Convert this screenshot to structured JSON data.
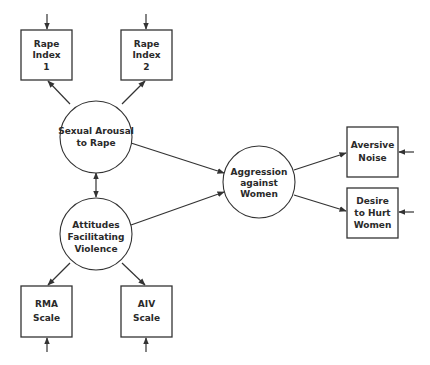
{
  "diagram": {
    "type": "path-model",
    "colors": {
      "stroke": "#333333",
      "text": "#2a2a2a",
      "background": "#ffffff"
    },
    "latent": [
      {
        "id": "arousal",
        "lines": [
          "Sexual Arousal",
          "to Rape"
        ]
      },
      {
        "id": "attitudes",
        "lines": [
          "Attitudes",
          "Facilitating",
          "Violence"
        ]
      },
      {
        "id": "aggression",
        "lines": [
          "Aggression",
          "against",
          "Women"
        ]
      }
    ],
    "observed": [
      {
        "id": "rape1",
        "lines": [
          "Rape",
          "Index",
          "1"
        ]
      },
      {
        "id": "rape2",
        "lines": [
          "Rape",
          "Index",
          "2"
        ]
      },
      {
        "id": "rma",
        "lines": [
          "RMA",
          "Scale"
        ]
      },
      {
        "id": "aiv",
        "lines": [
          "AIV",
          "Scale"
        ]
      },
      {
        "id": "noise",
        "lines": [
          "Aversive",
          "Noise"
        ]
      },
      {
        "id": "hurt",
        "lines": [
          "Desire",
          "to Hurt",
          "Women"
        ]
      }
    ],
    "edges": [
      {
        "from": "arousal",
        "to": "rape1",
        "type": "directed"
      },
      {
        "from": "arousal",
        "to": "rape2",
        "type": "directed"
      },
      {
        "from": "attitudes",
        "to": "rma",
        "type": "directed"
      },
      {
        "from": "attitudes",
        "to": "aiv",
        "type": "directed"
      },
      {
        "from": "arousal",
        "to": "attitudes",
        "type": "bidirectional"
      },
      {
        "from": "arousal",
        "to": "aggression",
        "type": "directed"
      },
      {
        "from": "attitudes",
        "to": "aggression",
        "type": "directed"
      },
      {
        "from": "aggression",
        "to": "noise",
        "type": "directed"
      },
      {
        "from": "aggression",
        "to": "hurt",
        "type": "directed"
      },
      {
        "from": "error",
        "to": "rape1",
        "type": "error-term"
      },
      {
        "from": "error",
        "to": "rape2",
        "type": "error-term"
      },
      {
        "from": "error",
        "to": "rma",
        "type": "error-term"
      },
      {
        "from": "error",
        "to": "aiv",
        "type": "error-term"
      },
      {
        "from": "error",
        "to": "noise",
        "type": "error-term"
      },
      {
        "from": "error",
        "to": "hurt",
        "type": "error-term"
      }
    ]
  }
}
